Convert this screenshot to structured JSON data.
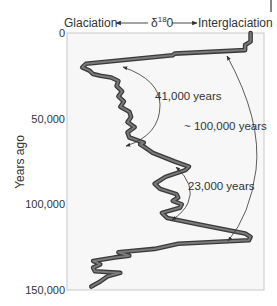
{
  "chart_data": {
    "type": "line",
    "title": "",
    "xlabel": "δ18O",
    "x_left_label": "Glaciation",
    "x_right_label": "Interglaciation",
    "ylabel": "Years ago",
    "y_ticks": [
      0,
      50000,
      100000,
      150000
    ],
    "y_tick_labels": [
      "0",
      "50,000",
      "100,000",
      "150,000"
    ],
    "ylim": [
      0,
      150000
    ],
    "y_inverted": true,
    "grid": false,
    "x_units": "relative (0 = glaciation, 1 = interglaciation)",
    "series": [
      {
        "name": "δ18O record",
        "points": [
          {
            "years": 0,
            "x": 0.97
          },
          {
            "years": 5000,
            "x": 0.97
          },
          {
            "years": 7000,
            "x": 0.94
          },
          {
            "years": 10000,
            "x": 0.94
          },
          {
            "years": 12000,
            "x": 0.55
          },
          {
            "years": 13000,
            "x": 0.54
          },
          {
            "years": 18000,
            "x": 0.06
          },
          {
            "years": 20000,
            "x": 0.04
          },
          {
            "years": 22000,
            "x": 0.08
          },
          {
            "years": 24000,
            "x": 0.1
          },
          {
            "years": 25000,
            "x": 0.14
          },
          {
            "years": 26000,
            "x": 0.2
          },
          {
            "years": 28000,
            "x": 0.24
          },
          {
            "years": 31000,
            "x": 0.23
          },
          {
            "years": 34000,
            "x": 0.26
          },
          {
            "years": 37000,
            "x": 0.24
          },
          {
            "years": 40000,
            "x": 0.27
          },
          {
            "years": 43000,
            "x": 0.25
          },
          {
            "years": 46000,
            "x": 0.3
          },
          {
            "years": 49000,
            "x": 0.31
          },
          {
            "years": 52000,
            "x": 0.29
          },
          {
            "years": 55000,
            "x": 0.33
          },
          {
            "years": 58000,
            "x": 0.29
          },
          {
            "years": 61000,
            "x": 0.3
          },
          {
            "years": 64000,
            "x": 0.38
          },
          {
            "years": 65000,
            "x": 0.36
          },
          {
            "years": 67000,
            "x": 0.39
          },
          {
            "years": 70000,
            "x": 0.43
          },
          {
            "years": 75000,
            "x": 0.55
          },
          {
            "years": 78000,
            "x": 0.63
          },
          {
            "years": 80000,
            "x": 0.61
          },
          {
            "years": 84000,
            "x": 0.5
          },
          {
            "years": 88000,
            "x": 0.44
          },
          {
            "years": 91000,
            "x": 0.47
          },
          {
            "years": 94000,
            "x": 0.56
          },
          {
            "years": 96000,
            "x": 0.57
          },
          {
            "years": 98000,
            "x": 0.54
          },
          {
            "years": 100000,
            "x": 0.59
          },
          {
            "years": 102000,
            "x": 0.58
          },
          {
            "years": 105000,
            "x": 0.48
          },
          {
            "years": 108000,
            "x": 0.51
          },
          {
            "years": 112000,
            "x": 0.7
          },
          {
            "years": 117000,
            "x": 0.94
          },
          {
            "years": 119000,
            "x": 0.97
          },
          {
            "years": 121000,
            "x": 0.96
          },
          {
            "years": 123000,
            "x": 0.57
          },
          {
            "years": 126000,
            "x": 0.44
          },
          {
            "years": 128000,
            "x": 0.24
          },
          {
            "years": 130000,
            "x": 0.3
          },
          {
            "years": 131000,
            "x": 0.22
          },
          {
            "years": 133000,
            "x": 0.1
          },
          {
            "years": 135000,
            "x": 0.14
          },
          {
            "years": 137000,
            "x": 0.1
          },
          {
            "years": 139000,
            "x": 0.11
          },
          {
            "years": 140000,
            "x": 0.25
          },
          {
            "years": 142000,
            "x": 0.18
          },
          {
            "years": 145000,
            "x": 0.14
          },
          {
            "years": 148000,
            "x": 0.09
          }
        ]
      }
    ],
    "annotations": [
      {
        "label": "41,000 years",
        "from_years": 22000,
        "to_years": 63000,
        "type": "double-arrow"
      },
      {
        "label": "~ 100,000 years",
        "from_years": 11000,
        "to_years": 120000,
        "type": "double-arrow"
      },
      {
        "label": "23,000 years",
        "from_years": 77000,
        "to_years": 99000,
        "type": "double-arrow"
      }
    ]
  },
  "labels": {
    "glaciation": "Glaciation",
    "interglaciation": "Interglaciation",
    "delta": "δ",
    "superscript": "18",
    "oxygen": "0",
    "y_axis": "Years ago",
    "tick_0": "0",
    "tick_50000": "50,000",
    "tick_100000": "100,000",
    "tick_150000": "150,000",
    "ann_41k": "41,000 years",
    "ann_100k": "~ 100,000 years",
    "ann_23k": "23,000 years"
  },
  "colors": {
    "curve_outline": "#3a3a3a",
    "curve_fill": "#7a7a7a",
    "plot_background": "#f7f7f7",
    "frame": "#c8c8c8",
    "text": "#333333"
  }
}
